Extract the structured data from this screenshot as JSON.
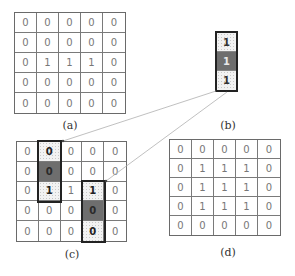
{
  "panels": {
    "a": {
      "label": "(a)",
      "grid": [
        [
          "0",
          "0",
          "0",
          "0",
          "0"
        ],
        [
          "0",
          "0",
          "0",
          "0",
          "0"
        ],
        [
          "0",
          "1",
          "1",
          "1",
          "0"
        ],
        [
          "0",
          "0",
          "0",
          "0",
          "0"
        ],
        [
          "0",
          "0",
          "0",
          "0",
          "0"
        ]
      ]
    },
    "b": {
      "label": "(b)",
      "kernel": [
        "1",
        "1",
        "1"
      ]
    },
    "c": {
      "label": "(c)",
      "grid": [
        [
          "0",
          "0",
          "0",
          "0",
          "0"
        ],
        [
          "0",
          "0",
          "0",
          "0",
          "0"
        ],
        [
          "0",
          "1",
          "1",
          "1",
          "0"
        ],
        [
          "0",
          "0",
          "0",
          "0",
          "0"
        ],
        [
          "0",
          "0",
          "0",
          "0",
          "0"
        ]
      ],
      "highlight_boxes": [
        {
          "col": 1,
          "rows": [
            0,
            2
          ],
          "center_row": 1
        },
        {
          "col": 3,
          "rows": [
            2,
            4
          ],
          "center_row": 3
        }
      ]
    },
    "d": {
      "label": "(d)",
      "grid": [
        [
          "0",
          "0",
          "0",
          "0",
          "0"
        ],
        [
          "0",
          "1",
          "1",
          "1",
          "0"
        ],
        [
          "0",
          "1",
          "1",
          "1",
          "0"
        ],
        [
          "0",
          "1",
          "1",
          "1",
          "0"
        ],
        [
          "0",
          "0",
          "0",
          "0",
          "0"
        ]
      ]
    }
  },
  "colors": {
    "dark_cell": "#6e6e6e",
    "grid_line": "#7a7a7a",
    "box_border": "#222222",
    "arrow_line": "#b0b0b0"
  }
}
